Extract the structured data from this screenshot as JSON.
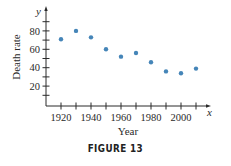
{
  "caption": "FIGURE 13",
  "colors": {
    "point": "#4585b8",
    "axis": "#2a2a2a"
  },
  "chart_data": {
    "type": "scatter",
    "title": "",
    "caption": "FIGURE 13",
    "xlabel": "Year",
    "ylabel": "Death rate",
    "x_axis_variable": "x",
    "y_axis_variable": "y",
    "xlim": [
      1910,
      2020
    ],
    "ylim": [
      0,
      90
    ],
    "x_ticks": [
      1920,
      1930,
      1940,
      1950,
      1960,
      1970,
      1980,
      1990,
      2000,
      2010
    ],
    "x_tick_labels": [
      "1920",
      "1940",
      "1960",
      "1980",
      "2000"
    ],
    "y_ticks": [
      10,
      20,
      30,
      40,
      50,
      60,
      70,
      80,
      90
    ],
    "y_tick_labels": [
      "20",
      "40",
      "60",
      "80"
    ],
    "grid": false,
    "legend": null,
    "x": [
      1920,
      1930,
      1940,
      1950,
      1960,
      1970,
      1980,
      1990,
      2000,
      2010
    ],
    "y": [
      71,
      80,
      73,
      60,
      52,
      56,
      46,
      36,
      34,
      39
    ]
  }
}
